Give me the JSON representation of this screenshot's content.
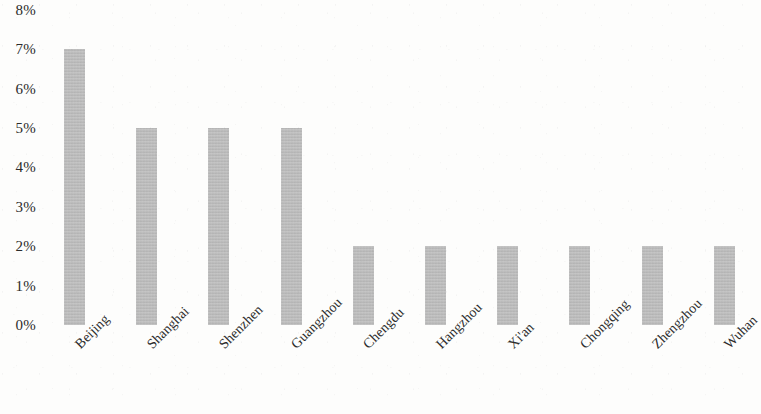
{
  "chart_data": {
    "type": "bar",
    "title": "",
    "subtitle": "",
    "xlabel": "",
    "ylabel": "",
    "categories": [
      "Beijing",
      "Shanghai",
      "Shenzhen",
      "Guangzhou",
      "Chengdu",
      "Hangzhou",
      "Xi'an",
      "Chongqing",
      "Zhengzhou",
      "Wuhan"
    ],
    "values": [
      7,
      5,
      5,
      5,
      2,
      2,
      2,
      2,
      2,
      2
    ],
    "value_unit": "%",
    "ylim": [
      0,
      8
    ],
    "y_tick_labels": [
      "8%",
      "7%",
      "6%",
      "5%",
      "4%",
      "3%",
      "2%",
      "1%",
      "0%"
    ],
    "y_tick_values": [
      8,
      7,
      6,
      5,
      4,
      3,
      2,
      1,
      0
    ],
    "grid": false,
    "legend": null,
    "legend_position": "none",
    "annotations": [],
    "bar_color": "#b5b5b5",
    "text_color": "#2b2b2b",
    "background_color": "#fdfdfc",
    "x_tick_rotation_degrees": -45
  }
}
